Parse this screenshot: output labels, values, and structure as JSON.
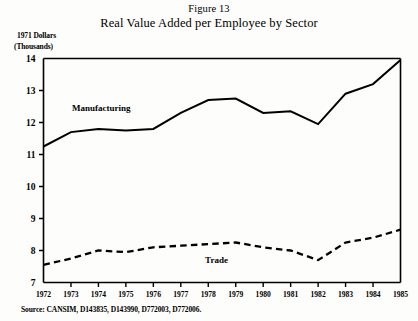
{
  "figure": {
    "number": "Figure 13",
    "title": "Real Value Added per Employee by Sector",
    "ylabel_line1": "1971 Dollars",
    "ylabel_line2": "(Thousands)",
    "source": "Source: CANSIM, D143835, D143990, D772003, D772006."
  },
  "chart_data": {
    "type": "line",
    "title": "Real Value Added per Employee by Sector",
    "subtitle": "Figure 13",
    "xlabel": "",
    "ylabel": "1971 Dollars (Thousands)",
    "x": [
      1972,
      1973,
      1974,
      1975,
      1976,
      1977,
      1978,
      1979,
      1980,
      1981,
      1982,
      1983,
      1984,
      1985
    ],
    "xtick_labels": [
      "1972",
      "1973",
      "1974",
      "1975",
      "1976",
      "1977",
      "1978",
      "1979",
      "1980",
      "1981",
      "1982",
      "1983",
      "1984",
      "1985"
    ],
    "ytick_labels": [
      "14",
      "13",
      "12",
      "11",
      "10",
      "9",
      "8",
      "7"
    ],
    "ylim": [
      7,
      14
    ],
    "xlim": [
      1972,
      1985
    ],
    "grid": false,
    "legend": "inline-annotations",
    "series": [
      {
        "name": "Manufacturing",
        "style": "solid",
        "color": "#000000",
        "label_x": 1974.1,
        "label_y": 12.35,
        "values": [
          11.25,
          11.7,
          11.8,
          11.75,
          11.8,
          12.3,
          12.7,
          12.75,
          12.3,
          12.35,
          11.95,
          12.9,
          13.2,
          13.95
        ]
      },
      {
        "name": "Trade",
        "style": "dashed",
        "color": "#000000",
        "label_x": 1978.3,
        "label_y": 7.62,
        "values": [
          7.55,
          7.75,
          8.0,
          7.95,
          8.1,
          8.15,
          8.2,
          8.25,
          8.1,
          8.0,
          7.7,
          8.25,
          8.4,
          8.65
        ]
      }
    ]
  }
}
